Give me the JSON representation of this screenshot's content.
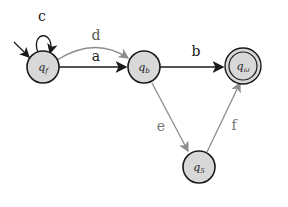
{
  "diagram": {
    "type": "finite-automaton",
    "colors": {
      "node_fill": "#d8d8d8",
      "node_stroke": "#1a1a1a",
      "dark_edge": "#1a1a1a",
      "gray_edge": "#8c8c8c",
      "text": "#222222"
    },
    "states": [
      {
        "id": "qf",
        "base": "q",
        "sub": "f",
        "initial": true,
        "accepting": false
      },
      {
        "id": "qb",
        "base": "q",
        "sub": "b",
        "initial": false,
        "accepting": false
      },
      {
        "id": "qw",
        "base": "q",
        "sub": "ω",
        "initial": false,
        "accepting": true
      },
      {
        "id": "q5",
        "base": "q",
        "sub": "5",
        "initial": false,
        "accepting": false
      }
    ],
    "transitions": [
      {
        "from": "qf",
        "to": "qf",
        "label": "c",
        "style": "dark"
      },
      {
        "from": "qf",
        "to": "qb",
        "label": "d",
        "style": "gray"
      },
      {
        "from": "qf",
        "to": "qb",
        "label": "a",
        "style": "dark"
      },
      {
        "from": "qb",
        "to": "qw",
        "label": "b",
        "style": "dark"
      },
      {
        "from": "qb",
        "to": "q5",
        "label": "e",
        "style": "gray"
      },
      {
        "from": "q5",
        "to": "qw",
        "label": "f",
        "style": "gray"
      }
    ]
  }
}
